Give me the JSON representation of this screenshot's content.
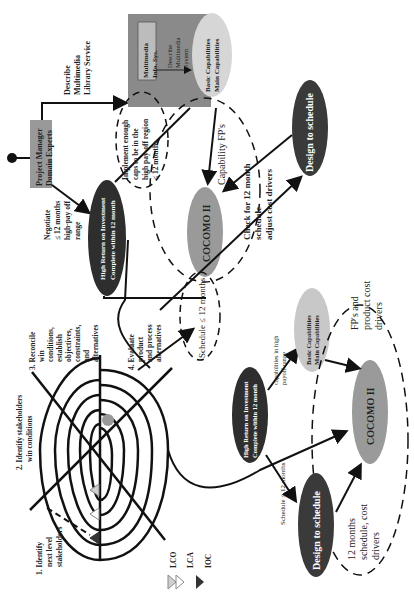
{
  "diagram": {
    "start": {
      "box": "Project Manager Domain Experts",
      "lines": [
        "Project Manager",
        "Domain Experts"
      ]
    },
    "describe_label": [
      "Describe",
      "Multimedia",
      "Library Service"
    ],
    "multimedia_panel": {
      "system_box": [
        "Multimedia",
        "Info. Sys."
      ],
      "describe_system": [
        "Describe",
        "Multimedia",
        "System"
      ],
      "capabilities": [
        "Basic Capabilities",
        "Main Capabilities"
      ]
    },
    "negotiate_label": [
      "Negotiate",
      "≤ 12 months",
      "high-pay off",
      "range"
    ],
    "hroi_top": [
      "High Return on Investment",
      "Complete within 12 month"
    ],
    "implement_label": [
      "Implement enough",
      "caps to be in the",
      "high pay-off region",
      "≤ 12 months"
    ],
    "capability_fps": "Capability FP's",
    "cocomo_top": "COCOMO II",
    "check_label": [
      "Check for 12 month",
      "schedule",
      "adjust cost drivers"
    ],
    "design_top": "Design to schedule",
    "schedule_top": "Schedule ≤ 12 months",
    "spiral_steps": {
      "s1": [
        "1.  Identify",
        "next level",
        "stakeholders"
      ],
      "s2": [
        "2. Identify stakeholders",
        "win conditions"
      ],
      "s3": [
        "3. Reconcile",
        "win",
        "conditions,",
        "establish",
        "objectives,",
        "constraints,",
        "and",
        "alternatives"
      ],
      "s4": [
        "4. Evaluate",
        "product",
        "and process",
        "alternatives"
      ]
    },
    "legend": [
      {
        "label": "LCO",
        "color": "#d0d0d0"
      },
      {
        "label": "LCA",
        "color": "#ffffff"
      },
      {
        "label": "IOC",
        "color": "#333333"
      }
    ],
    "bottom": {
      "hroi": [
        "High Return on Investment",
        "Complete within 12 month"
      ],
      "capabilities_label": [
        "capabilities in high",
        "payoff range"
      ],
      "capabilities": [
        "Basic Capabilities",
        "Main Capabilities"
      ],
      "fps_label": [
        "FP's and",
        "product cost",
        "drivers"
      ],
      "cocomo": "COCOMO II",
      "schedule_label": "Schedule ≤ 12 months",
      "design": "Design to schedule",
      "twelve_label": [
        "12 months",
        "schedule, cost",
        "drivers"
      ]
    },
    "colors": {
      "dark_ellipse": "#2e2e2e",
      "mid_gray": "#9a9a9a",
      "light_gray": "#c8c8c8",
      "panel_gray": "#8a8a8a"
    }
  }
}
